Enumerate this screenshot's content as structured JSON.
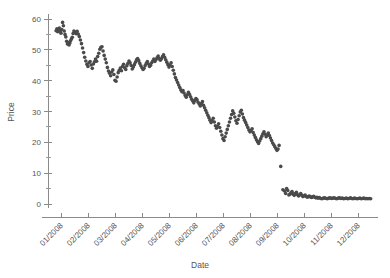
{
  "chart_data": {
    "type": "scatter",
    "title": "",
    "xlabel": "Date",
    "ylabel": "Price",
    "grid": false,
    "legend": null,
    "point_color": "#4a4a4a",
    "axis_color": "#8a8a8a",
    "text_color": "#555555",
    "background": "#ffffff",
    "ylim": [
      0,
      60
    ],
    "y_ticks_major": [
      0,
      10,
      20,
      30,
      40,
      50,
      60
    ],
    "y_ticks_minor": [
      5,
      15,
      25,
      35,
      45,
      55
    ],
    "x_tick_labels": [
      "01/2008",
      "02/2008",
      "03/2008",
      "04/2008",
      "05/2008",
      "06/2008",
      "07/2008",
      "08/2008",
      "09/2008",
      "10/2008",
      "11/2008",
      "12/2008"
    ],
    "x_tick_positions": [
      0.5,
      1.5,
      2.5,
      3.5,
      4.5,
      5.5,
      6.5,
      7.5,
      8.5,
      9.5,
      10.5,
      11.5
    ],
    "xlim_months": [
      0,
      12
    ],
    "x_unit": "month index of 2008",
    "series": [
      {
        "name": "Price",
        "marker": "circle",
        "marker_size_px": 1.8,
        "x": [
          0.3,
          0.33,
          0.36,
          0.39,
          0.42,
          0.45,
          0.48,
          0.51,
          0.54,
          0.57,
          0.6,
          0.63,
          0.66,
          0.69,
          0.72,
          0.75,
          0.78,
          0.81,
          0.84,
          0.87,
          0.9,
          0.93,
          0.96,
          1.0,
          1.04,
          1.08,
          1.12,
          1.16,
          1.2,
          1.24,
          1.28,
          1.32,
          1.36,
          1.4,
          1.44,
          1.48,
          1.52,
          1.56,
          1.6,
          1.64,
          1.68,
          1.72,
          1.76,
          1.8,
          1.84,
          1.88,
          1.92,
          1.96,
          2.0,
          2.04,
          2.08,
          2.12,
          2.16,
          2.2,
          2.24,
          2.28,
          2.32,
          2.36,
          2.4,
          2.44,
          2.48,
          2.52,
          2.56,
          2.6,
          2.64,
          2.68,
          2.72,
          2.76,
          2.8,
          2.84,
          2.88,
          2.92,
          2.96,
          3.0,
          3.04,
          3.08,
          3.12,
          3.16,
          3.2,
          3.24,
          3.28,
          3.32,
          3.36,
          3.4,
          3.44,
          3.48,
          3.52,
          3.56,
          3.6,
          3.64,
          3.68,
          3.72,
          3.76,
          3.8,
          3.84,
          3.88,
          3.92,
          3.96,
          4.0,
          4.04,
          4.08,
          4.12,
          4.16,
          4.2,
          4.24,
          4.28,
          4.32,
          4.36,
          4.4,
          4.44,
          4.48,
          4.52,
          4.56,
          4.6,
          4.64,
          4.68,
          4.72,
          4.76,
          4.8,
          4.84,
          4.88,
          4.92,
          4.96,
          5.0,
          5.04,
          5.08,
          5.12,
          5.16,
          5.2,
          5.24,
          5.28,
          5.32,
          5.36,
          5.4,
          5.44,
          5.48,
          5.52,
          5.56,
          5.6,
          5.64,
          5.68,
          5.72,
          5.76,
          5.8,
          5.84,
          5.88,
          5.92,
          5.96,
          6.0,
          6.04,
          6.08,
          6.12,
          6.16,
          6.2,
          6.24,
          6.28,
          6.32,
          6.36,
          6.4,
          6.44,
          6.48,
          6.52,
          6.56,
          6.6,
          6.64,
          6.68,
          6.72,
          6.76,
          6.8,
          6.84,
          6.88,
          6.92,
          6.96,
          7.0,
          7.04,
          7.08,
          7.12,
          7.16,
          7.2,
          7.24,
          7.28,
          7.32,
          7.36,
          7.4,
          7.44,
          7.48,
          7.52,
          7.56,
          7.6,
          7.64,
          7.68,
          7.72,
          7.76,
          7.8,
          7.84,
          7.88,
          7.92,
          7.96,
          8.0,
          8.04,
          8.08,
          8.12,
          8.16,
          8.2,
          8.24,
          8.28,
          8.32,
          8.36,
          8.4,
          8.44,
          8.48,
          8.52,
          8.56,
          8.62,
          8.7,
          8.76,
          8.8,
          8.84,
          8.88,
          8.92,
          8.96,
          9.0,
          9.04,
          9.08,
          9.12,
          9.16,
          9.2,
          9.24,
          9.28,
          9.32,
          9.36,
          9.4,
          9.44,
          9.48,
          9.52,
          9.56,
          9.6,
          9.64,
          9.68,
          9.72,
          9.76,
          9.8,
          9.84,
          9.88,
          9.92,
          9.96,
          10.0,
          10.05,
          10.1,
          10.15,
          10.2,
          10.25,
          10.3,
          10.35,
          10.4,
          10.45,
          10.5,
          10.55,
          10.6,
          10.65,
          10.7,
          10.75,
          10.8,
          10.85,
          10.9,
          10.95,
          11.0,
          11.05,
          11.1,
          11.15,
          11.2,
          11.25,
          11.3,
          11.35,
          11.4,
          11.45,
          11.5,
          11.55,
          11.6,
          11.65,
          11.7,
          11.75,
          11.8,
          11.85,
          11.9,
          11.95
        ],
        "y": [
          56.2,
          56.8,
          55.9,
          56.4,
          57.1,
          56.0,
          55.4,
          56.6,
          58.9,
          57.8,
          56.1,
          55.0,
          54.2,
          52.8,
          51.9,
          52.4,
          51.6,
          52.2,
          53.0,
          53.6,
          54.1,
          55.3,
          56.1,
          55.8,
          55.2,
          56.0,
          55.1,
          54.3,
          53.2,
          52.0,
          50.6,
          49.1,
          47.6,
          46.4,
          45.3,
          44.6,
          45.8,
          46.2,
          45.1,
          44.0,
          45.4,
          46.1,
          47.0,
          46.3,
          47.8,
          48.9,
          50.2,
          50.8,
          51.0,
          49.6,
          48.2,
          47.0,
          45.8,
          44.3,
          43.1,
          42.4,
          41.6,
          42.8,
          43.5,
          42.0,
          40.1,
          39.8,
          41.2,
          42.6,
          43.4,
          44.1,
          43.2,
          44.6,
          45.3,
          44.2,
          43.6,
          44.8,
          45.6,
          46.4,
          45.8,
          44.9,
          43.8,
          44.4,
          45.2,
          46.0,
          46.8,
          47.2,
          46.5,
          45.6,
          44.8,
          44.2,
          43.6,
          44.0,
          44.9,
          45.6,
          46.2,
          45.4,
          44.6,
          45.0,
          45.8,
          46.4,
          47.0,
          46.2,
          46.8,
          47.4,
          48.0,
          47.2,
          46.6,
          47.1,
          47.8,
          48.4,
          47.6,
          46.8,
          46.0,
          45.2,
          44.4,
          45.1,
          45.8,
          44.6,
          43.4,
          42.2,
          41.0,
          40.2,
          39.4,
          38.6,
          37.8,
          37.0,
          36.4,
          36.8,
          36.0,
          35.2,
          34.6,
          35.4,
          36.2,
          35.6,
          34.8,
          34.0,
          33.4,
          32.8,
          33.6,
          34.2,
          33.8,
          33.0,
          32.4,
          31.8,
          32.6,
          33.2,
          32.0,
          31.2,
          30.4,
          29.6,
          28.8,
          28.0,
          27.2,
          26.4,
          27.0,
          27.8,
          26.6,
          25.4,
          24.6,
          25.2,
          26.0,
          24.8,
          23.6,
          22.4,
          21.2,
          20.6,
          21.8,
          23.0,
          24.2,
          25.4,
          26.6,
          27.8,
          29.0,
          30.2,
          29.4,
          28.2,
          27.0,
          26.2,
          27.4,
          28.6,
          29.8,
          30.4,
          29.2,
          28.0,
          27.2,
          26.4,
          25.6,
          24.8,
          24.0,
          23.4,
          23.8,
          24.4,
          23.2,
          22.4,
          21.6,
          20.8,
          20.2,
          19.6,
          20.4,
          21.2,
          22.0,
          22.8,
          23.4,
          22.6,
          21.8,
          22.4,
          23.0,
          22.2,
          21.4,
          20.6,
          19.8,
          19.2,
          18.6,
          18.0,
          17.4,
          17.8,
          19.0,
          12.2,
          4.6,
          4.2,
          3.4,
          5.0,
          4.4,
          2.9,
          3.2,
          3.6,
          4.0,
          3.2,
          2.8,
          3.4,
          3.8,
          3.0,
          2.6,
          3.0,
          3.4,
          2.8,
          2.4,
          2.6,
          2.9,
          2.5,
          2.2,
          2.4,
          2.6,
          2.3,
          2.1,
          2.3,
          2.5,
          2.2,
          2.0,
          2.2,
          1.9,
          2.1,
          1.8,
          1.7,
          1.9,
          2.0,
          1.8,
          1.7,
          1.9,
          2.0,
          1.8,
          1.9,
          2.0,
          1.8,
          1.7,
          1.9,
          2.0,
          1.8,
          1.9,
          1.7,
          1.8,
          1.9,
          1.7,
          1.8,
          2.0,
          1.8,
          1.7,
          1.9,
          1.8,
          1.7,
          1.8,
          1.9,
          1.7,
          1.8,
          1.9,
          1.7,
          1.8,
          1.7,
          1.8,
          1.7
        ]
      }
    ]
  }
}
